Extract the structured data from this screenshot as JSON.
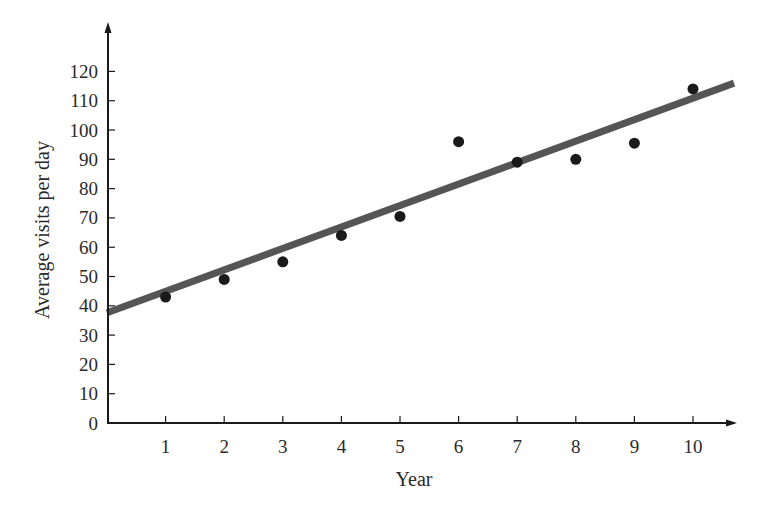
{
  "chart_data": {
    "type": "scatter",
    "title": "",
    "xlabel": "Year",
    "ylabel": "Average visits per day",
    "x_ticks": [
      1,
      2,
      3,
      4,
      5,
      6,
      7,
      8,
      9,
      10
    ],
    "y_ticks": [
      0,
      10,
      20,
      30,
      40,
      50,
      60,
      70,
      80,
      90,
      100,
      110,
      120
    ],
    "xlim": [
      0,
      10.75
    ],
    "ylim": [
      0,
      136
    ],
    "grid": false,
    "legend": null,
    "series": [
      {
        "name": "Observed",
        "kind": "scatter",
        "x": [
          1,
          2,
          3,
          4,
          5,
          6,
          7,
          8,
          9,
          10
        ],
        "y": [
          43,
          49,
          55,
          64,
          70.5,
          96,
          89,
          90,
          95.5,
          114
        ]
      },
      {
        "name": "Trend line",
        "kind": "line",
        "x": [
          0,
          10.7
        ],
        "y": [
          37.6,
          116
        ]
      }
    ]
  },
  "colors": {
    "axis": "#1a1a1a",
    "point": "#1a1a1a",
    "trend_line": "#555555",
    "text": "#2a2a2a"
  }
}
